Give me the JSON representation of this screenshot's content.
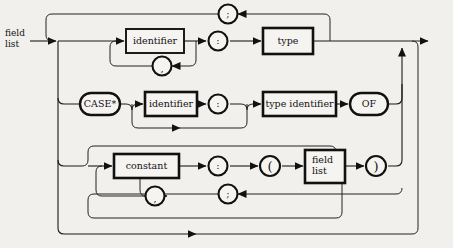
{
  "diagram": {
    "kind": "syntax-railroad-diagram",
    "title": "field list",
    "entry_label": "field\nlist",
    "entry_label_line1": "field",
    "entry_label_line2": "list",
    "colors": {
      "background": "#f2f0ec",
      "line": "#1a1a1a",
      "node_fill": "#f6f4f1",
      "text": "#111111"
    }
  },
  "rows": {
    "row1": {
      "name": "plain-field-row",
      "identifier": "identifier",
      "separator_comma": ",",
      "colon": ":",
      "type": "type",
      "loop_semicolon": ";"
    },
    "row2": {
      "name": "variant-case-row",
      "case_keyword": "CASE*",
      "identifier": "identifier",
      "colon": ":",
      "type_identifier": "type identifier",
      "of_keyword": "OF"
    },
    "row3": {
      "name": "variant-selector-row",
      "constant": "constant",
      "separator_comma": ",",
      "colon": ":",
      "lparen": "(",
      "field_list_line1": "field",
      "field_list_line2": "list",
      "rparen": ")",
      "loop_semicolon": ";"
    }
  },
  "nodes": [
    {
      "id": "identifier-1",
      "shape": "box",
      "text": "identifier",
      "row": 1
    },
    {
      "id": "comma-1",
      "shape": "circle",
      "text": ",",
      "row": 1
    },
    {
      "id": "semicolon-top",
      "shape": "circle",
      "text": ";",
      "row": 1
    },
    {
      "id": "colon-1",
      "shape": "circle",
      "text": ":",
      "row": 1
    },
    {
      "id": "type",
      "shape": "box",
      "text": "type",
      "row": 1
    },
    {
      "id": "case-keyword",
      "shape": "oval",
      "text": "CASE*",
      "row": 2
    },
    {
      "id": "identifier-2",
      "shape": "box",
      "text": "identifier",
      "row": 2
    },
    {
      "id": "colon-2",
      "shape": "circle",
      "text": ":",
      "row": 2
    },
    {
      "id": "type-identifier",
      "shape": "box",
      "text": "type identifier",
      "row": 2
    },
    {
      "id": "of-keyword",
      "shape": "oval",
      "text": "OF",
      "row": 2
    },
    {
      "id": "constant",
      "shape": "box",
      "text": "constant",
      "row": 3
    },
    {
      "id": "comma-2",
      "shape": "circle",
      "text": ",",
      "row": 3
    },
    {
      "id": "colon-3",
      "shape": "circle",
      "text": ":",
      "row": 3
    },
    {
      "id": "lparen",
      "shape": "circle",
      "text": "(",
      "row": 3
    },
    {
      "id": "field-list-box",
      "shape": "box",
      "text": "field list",
      "row": 3
    },
    {
      "id": "rparen",
      "shape": "circle",
      "text": ")",
      "row": 3
    },
    {
      "id": "semicolon-bottom",
      "shape": "circle",
      "text": ";",
      "row": 3
    }
  ]
}
